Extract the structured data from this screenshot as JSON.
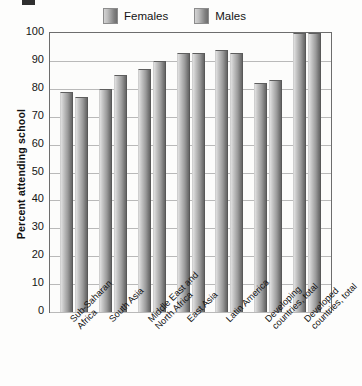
{
  "legend": {
    "position": "top-center",
    "items": [
      {
        "label": "Females",
        "swatch": "gray-gradient-swatch"
      },
      {
        "label": "Males",
        "swatch": "gray-gradient-swatch"
      }
    ]
  },
  "axis": {
    "y_title": "Percent attending school",
    "y_ticks": [
      "100",
      "90",
      "80",
      "70",
      "60",
      "50",
      "40",
      "30",
      "20",
      "10",
      "0"
    ]
  },
  "chart_data": {
    "type": "bar",
    "title": "",
    "xlabel": "",
    "ylabel": "Percent attending school",
    "ylim": [
      0,
      100
    ],
    "ytick_step": 10,
    "grid": true,
    "legend_position": "top-center",
    "categories": [
      "Sub-Saharan\nAfrica",
      "South Asia",
      "Middle East and\nNorth Africa",
      "East Asia",
      "Latin America",
      "Developing\ncountries, total",
      "Developed\ncountries, total"
    ],
    "series": [
      {
        "name": "Females",
        "values": [
          79,
          80,
          87,
          93,
          94,
          82,
          100
        ]
      },
      {
        "name": "Males",
        "values": [
          77,
          85,
          90,
          93,
          93,
          83,
          100
        ]
      }
    ]
  }
}
